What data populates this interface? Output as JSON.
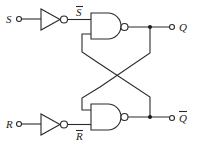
{
  "diagram": {
    "inputs": [
      {
        "label": "S",
        "inverted_label": "S̄"
      },
      {
        "label": "R",
        "inverted_label": "R̄"
      }
    ],
    "outputs": [
      {
        "label": "Q"
      },
      {
        "label": "Q̄"
      }
    ],
    "labels": {
      "s_input": "S",
      "s_bar": "S",
      "r_input": "R",
      "r_bar": "R",
      "q_output": "Q",
      "q_bar_output": "Q"
    },
    "components": [
      "inverter-top",
      "inverter-bottom",
      "nand-top",
      "nand-bottom"
    ],
    "colors": {
      "stroke": "#2a2a2a",
      "background": "#ffffff"
    }
  }
}
